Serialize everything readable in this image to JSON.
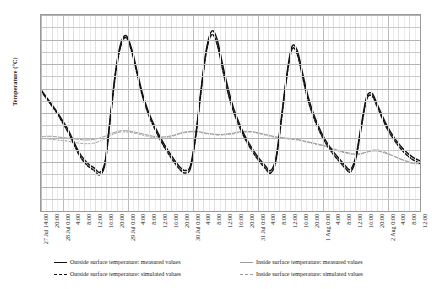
{
  "chart": {
    "type": "line",
    "ylabel": "Temperature (°C)",
    "xlabel": ""
  },
  "yaxis": {
    "ticks": [
      48,
      46,
      44,
      42,
      40,
      38,
      36,
      34,
      32,
      30,
      28,
      26,
      24,
      22,
      20,
      18,
      16
    ],
    "min": 16,
    "max": 48,
    "step": 2
  },
  "xaxis": {
    "ticks": [
      "27 Jul 14:00",
      "20:00",
      "28 Jul 0:00",
      "4:00",
      "8:00",
      "12:00",
      "16:00",
      "20:00",
      "29 Jul 0:00",
      "4:00",
      "8:00",
      "12:00",
      "16:00",
      "20:00",
      "30 Jul 0:00",
      "4:00",
      "8:00",
      "12:00",
      "16:00",
      "20:00",
      "31 Jul 0:00",
      "4:00",
      "8:00",
      "12:00",
      "16:00",
      "20:00",
      "1 Aug 0:00",
      "4:00",
      "8:00",
      "12:00",
      "16:00",
      "20:00",
      "2 Aug 0:00",
      "4:00",
      "8:00",
      "12:00"
    ]
  },
  "legend": {
    "items": [
      {
        "label": "Outside surface temperature: measured values",
        "style": "solid-dark",
        "column": 1
      },
      {
        "label": "Outside surface temperature: simulated values",
        "style": "dash-dark",
        "column": 1
      },
      {
        "label": "Inside surface temperature: measured values",
        "style": "solid-gray",
        "column": 2
      },
      {
        "label": "Inside surface temperature: simulated values",
        "style": "dash-gray",
        "column": 2
      }
    ]
  },
  "colors": {
    "outside_measured": "#111111",
    "outside_simulated": "#111111",
    "inside_measured": "#9d9d9d",
    "inside_simulated": "#9d9d9d",
    "grid": "#c9c9c9",
    "frame": "#9a9a9a"
  },
  "chart_data": {
    "type": "line",
    "title": "",
    "xlabel": "",
    "ylabel": "Temperature (°C)",
    "ylim": [
      16,
      48
    ],
    "grid": true,
    "legend_position": "bottom",
    "x": [
      "27 Jul 14:00",
      "27 Jul 16:00",
      "27 Jul 18:00",
      "27 Jul 20:00",
      "27 Jul 22:00",
      "28 Jul 0:00",
      "28 Jul 2:00",
      "28 Jul 4:00",
      "28 Jul 6:00",
      "28 Jul 8:00",
      "28 Jul 10:00",
      "28 Jul 12:00",
      "28 Jul 14:00",
      "28 Jul 16:00",
      "28 Jul 18:00",
      "28 Jul 20:00",
      "28 Jul 22:00",
      "29 Jul 0:00",
      "29 Jul 2:00",
      "29 Jul 4:00",
      "29 Jul 6:00",
      "29 Jul 8:00",
      "29 Jul 10:00",
      "29 Jul 12:00",
      "29 Jul 14:00",
      "29 Jul 16:00",
      "29 Jul 18:00",
      "29 Jul 20:00",
      "29 Jul 22:00",
      "30 Jul 0:00",
      "30 Jul 2:00",
      "30 Jul 4:00",
      "30 Jul 6:00",
      "30 Jul 8:00",
      "30 Jul 10:00",
      "30 Jul 12:00",
      "30 Jul 14:00",
      "30 Jul 16:00",
      "30 Jul 18:00",
      "30 Jul 20:00",
      "30 Jul 22:00",
      "31 Jul 0:00",
      "31 Jul 2:00",
      "31 Jul 4:00",
      "31 Jul 6:00",
      "31 Jul 8:00",
      "31 Jul 10:00",
      "31 Jul 12:00",
      "31 Jul 14:00",
      "31 Jul 16:00",
      "31 Jul 18:00",
      "31 Jul 20:00",
      "31 Jul 22:00",
      "1 Aug 0:00",
      "1 Aug 2:00",
      "1 Aug 4:00",
      "1 Aug 6:00",
      "1 Aug 8:00",
      "1 Aug 10:00",
      "1 Aug 12:00",
      "1 Aug 14:00",
      "1 Aug 16:00",
      "1 Aug 18:00",
      "1 Aug 20:00",
      "1 Aug 22:00",
      "2 Aug 0:00",
      "2 Aug 2:00",
      "2 Aug 4:00",
      "2 Aug 6:00",
      "2 Aug 8:00",
      "2 Aug 10:00",
      "2 Aug 12:00"
    ],
    "series": [
      {
        "name": "Outside surface temperature: measured values",
        "style": "solid",
        "color": "#111111",
        "values": [
          35.8,
          34.6,
          33.4,
          32.2,
          30.8,
          29.4,
          27.6,
          25.8,
          24.5,
          23.6,
          23.0,
          22.3,
          24.0,
          31.5,
          39.0,
          43.5,
          44.6,
          42.4,
          38.8,
          35.2,
          32.5,
          30.4,
          28.6,
          27.0,
          25.6,
          24.3,
          23.2,
          22.6,
          23.4,
          28.5,
          36.0,
          42.5,
          45.4,
          44.0,
          40.0,
          36.2,
          33.0,
          30.6,
          28.6,
          27.0,
          25.6,
          24.4,
          23.4,
          22.6,
          24.6,
          31.0,
          38.0,
          42.8,
          42.2,
          38.5,
          34.8,
          32.0,
          29.8,
          28.0,
          26.6,
          25.4,
          24.4,
          23.4,
          22.8,
          25.0,
          30.0,
          34.6,
          35.2,
          33.4,
          31.4,
          29.6,
          28.2,
          27.0,
          26.0,
          25.2,
          24.6,
          24.2
        ]
      },
      {
        "name": "Outside surface temperature: simulated values",
        "style": "dashed",
        "color": "#111111",
        "values": [
          35.6,
          34.4,
          33.2,
          32.0,
          30.5,
          29.0,
          27.2,
          25.4,
          24.1,
          23.2,
          22.6,
          21.9,
          23.8,
          31.2,
          38.6,
          43.1,
          44.3,
          42.0,
          38.4,
          34.8,
          32.1,
          30.0,
          28.2,
          26.6,
          25.2,
          23.9,
          22.8,
          22.2,
          23.0,
          28.2,
          35.6,
          42.1,
          44.8,
          43.2,
          39.2,
          35.4,
          32.4,
          30.1,
          28.2,
          26.6,
          25.2,
          24.0,
          23.0,
          22.2,
          24.2,
          30.6,
          37.6,
          42.4,
          41.6,
          37.9,
          34.2,
          31.5,
          29.4,
          27.6,
          26.2,
          25.0,
          24.0,
          23.0,
          22.4,
          24.6,
          29.6,
          34.2,
          34.8,
          33.0,
          31.0,
          29.2,
          27.8,
          26.6,
          25.6,
          24.8,
          24.2,
          23.8
        ]
      },
      {
        "name": "Inside surface temperature: measured values",
        "style": "solid",
        "color": "#9d9d9d",
        "values": [
          28.1,
          28.2,
          28.2,
          28.1,
          28.0,
          27.9,
          27.8,
          27.7,
          27.6,
          27.6,
          27.7,
          27.9,
          28.2,
          28.6,
          28.9,
          29.1,
          29.1,
          29.0,
          28.8,
          28.6,
          28.4,
          28.2,
          28.1,
          28.1,
          28.2,
          28.4,
          28.7,
          28.9,
          29.0,
          29.0,
          28.9,
          28.7,
          28.6,
          28.5,
          28.5,
          28.6,
          28.7,
          28.9,
          29.0,
          29.0,
          28.9,
          28.7,
          28.5,
          28.3,
          28.1,
          28.0,
          27.9,
          27.8,
          27.7,
          27.5,
          27.3,
          27.1,
          26.9,
          26.7,
          26.4,
          26.1,
          25.8,
          25.6,
          25.4,
          25.3,
          25.4,
          25.6,
          25.8,
          25.8,
          25.6,
          25.3,
          25.0,
          24.6,
          24.3,
          24.0,
          23.8,
          23.8
        ]
      },
      {
        "name": "Inside surface temperature: simulated values",
        "style": "dashed",
        "color": "#9d9d9d",
        "values": [
          27.8,
          27.8,
          27.7,
          27.6,
          27.5,
          27.4,
          27.2,
          27.1,
          27.0,
          27.0,
          27.1,
          27.4,
          27.8,
          28.3,
          28.7,
          28.9,
          28.9,
          28.8,
          28.6,
          28.4,
          28.2,
          28.0,
          27.9,
          27.9,
          28.0,
          28.3,
          28.6,
          28.8,
          28.9,
          28.9,
          28.8,
          28.6,
          28.5,
          28.4,
          28.4,
          28.5,
          28.6,
          28.8,
          28.9,
          28.9,
          28.8,
          28.6,
          28.4,
          28.2,
          28.0,
          27.9,
          27.8,
          27.7,
          27.6,
          27.4,
          27.2,
          27.0,
          26.8,
          26.6,
          26.3,
          26.0,
          25.7,
          25.5,
          25.3,
          25.2,
          25.3,
          25.6,
          25.9,
          26.0,
          25.8,
          25.4,
          25.0,
          24.6,
          24.2,
          23.9,
          23.7,
          23.7
        ]
      }
    ]
  }
}
